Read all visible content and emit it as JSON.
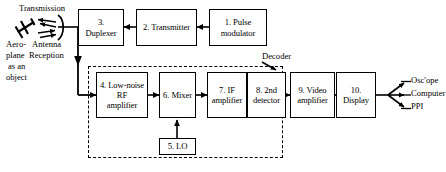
{
  "diagram": {
    "line_color": "#000000",
    "background": "#ffffff",
    "blocks": [
      {
        "id": "pulse_modulator",
        "label": "1. Pulse\nmodulator",
        "line1": "1. Pulse",
        "line2": "modulator"
      },
      {
        "id": "transmitter",
        "label": "2. Transmitter",
        "line1": "2. Transmitter",
        "line2": ""
      },
      {
        "id": "duplexer",
        "label": "3.\nDuplexer",
        "line1": "3.",
        "line2": "Duplexer"
      },
      {
        "id": "lna",
        "label": "4. Low-noise\nRF\namplifier",
        "line1": "4. Low-noise",
        "line2": "RF",
        "line3": "amplifier"
      },
      {
        "id": "lo",
        "label": "5. LO",
        "line1": "5. LO",
        "line2": ""
      },
      {
        "id": "mixer",
        "label": "6. Mixer",
        "line1": "6. Mixer",
        "line2": ""
      },
      {
        "id": "if_amplifier",
        "label": "7. IF\namplifier",
        "line1": "7. IF",
        "line2": "amplifier"
      },
      {
        "id": "second_detector",
        "label": "8. 2nd\ndetector",
        "line1": "8. 2nd",
        "line2": "detector"
      },
      {
        "id": "video_amplifier",
        "label": "9. Video\namplifier",
        "line1": "9. Video",
        "line2": "amplifier"
      },
      {
        "id": "display",
        "label": "10.\nDisplay",
        "line1": "10.",
        "line2": "Display"
      }
    ],
    "annotations": {
      "transmission": "Transmission",
      "reception": "Reception",
      "antenna": "Antenna",
      "target_line1": "Aero-",
      "target_line2": "plane",
      "target_line3": "as an",
      "target_line4": "object",
      "decoder": "Decoder"
    },
    "outputs": [
      {
        "id": "oscilloscope",
        "label": "Osc'ope"
      },
      {
        "id": "computer",
        "label": "Computer"
      },
      {
        "id": "ppi",
        "label": "PPI"
      }
    ]
  }
}
